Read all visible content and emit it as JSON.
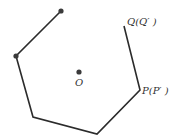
{
  "diagram": {
    "type": "geometry",
    "stroke_color": "#2b2b2b",
    "point_color": "#3a3a3a",
    "path_points": [
      {
        "x": 61,
        "y": 11,
        "dot": true
      },
      {
        "x": 16,
        "y": 56,
        "dot": true
      },
      {
        "x": 33,
        "y": 117,
        "dot": false
      },
      {
        "x": 97,
        "y": 134,
        "dot": false
      },
      {
        "x": 140,
        "y": 90,
        "dot": false
      },
      {
        "x": 124,
        "y": 26,
        "dot": false
      }
    ],
    "center": {
      "x": 79,
      "y": 72,
      "label": "O"
    },
    "labels": {
      "O": "O",
      "P": "P(P′ )",
      "Q": "Q(Q′ )"
    }
  }
}
